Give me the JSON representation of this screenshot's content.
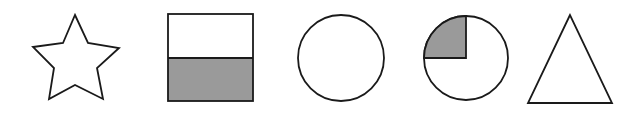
{
  "figure": {
    "colors": {
      "stroke": "#1a1a1a",
      "fill_shaded": "#9a9a9a",
      "fill_empty": "#ffffff"
    },
    "shapes": [
      {
        "type": "star",
        "shaded_fraction": "0"
      },
      {
        "type": "square",
        "shaded_fraction": "1/2",
        "shaded_region": "bottom half"
      },
      {
        "type": "circle",
        "shaded_fraction": "0"
      },
      {
        "type": "circle",
        "shaded_fraction": "1/4",
        "shaded_region": "top-left quarter"
      },
      {
        "type": "triangle",
        "shaded_fraction": "0"
      }
    ]
  }
}
